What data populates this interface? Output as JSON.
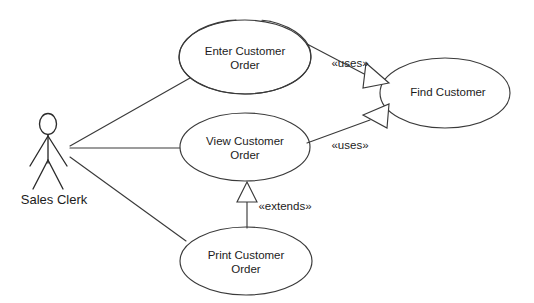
{
  "diagram": {
    "kind": "uml-use-case-diagram",
    "width": 534,
    "height": 303,
    "background_color": "#ffffff",
    "stroke_color": "#3a3a3a",
    "text_color": "#1c1c1c"
  },
  "actors": [
    {
      "id": "sales-clerk",
      "label": "Sales Clerk",
      "cx": 48,
      "label_x": 54,
      "label_y": 201
    }
  ],
  "use_cases": [
    {
      "id": "enter-customer-order",
      "line1": "Enter Customer",
      "line2": "Order",
      "cx": 245,
      "cy": 57,
      "rx": 66,
      "ry": 37
    },
    {
      "id": "view-customer-order",
      "line1": "View Customer",
      "line2": "Order",
      "cx": 245,
      "cy": 147,
      "rx": 65,
      "ry": 34
    },
    {
      "id": "print-customer-order",
      "line1": "Print Customer",
      "line2": "Order",
      "cx": 246,
      "cy": 261,
      "rx": 66,
      "ry": 34
    },
    {
      "id": "find-customer",
      "line1": "Find Customer",
      "line2": "",
      "cx": 445,
      "cy": 93,
      "rx": 65,
      "ry": 35
    }
  ],
  "relationships": [
    {
      "id": "clerk-to-enter",
      "type": "association",
      "from": "sales-clerk",
      "to": "enter-customer-order",
      "label": ""
    },
    {
      "id": "clerk-to-view",
      "type": "association",
      "from": "sales-clerk",
      "to": "view-customer-order",
      "label": ""
    },
    {
      "id": "clerk-to-print",
      "type": "association",
      "from": "sales-clerk",
      "to": "print-customer-order",
      "label": ""
    },
    {
      "id": "enter-uses-find",
      "type": "uses",
      "from": "enter-customer-order",
      "to": "find-customer",
      "label": "«uses»",
      "label_x": 350,
      "label_y": 64
    },
    {
      "id": "view-uses-find",
      "type": "uses",
      "from": "view-customer-order",
      "to": "find-customer",
      "label": "«uses»",
      "label_x": 350,
      "label_y": 146
    },
    {
      "id": "print-extends-view",
      "type": "extends",
      "from": "print-customer-order",
      "to": "view-customer-order",
      "label": "«extends»",
      "label_x": 285,
      "label_y": 207
    }
  ]
}
